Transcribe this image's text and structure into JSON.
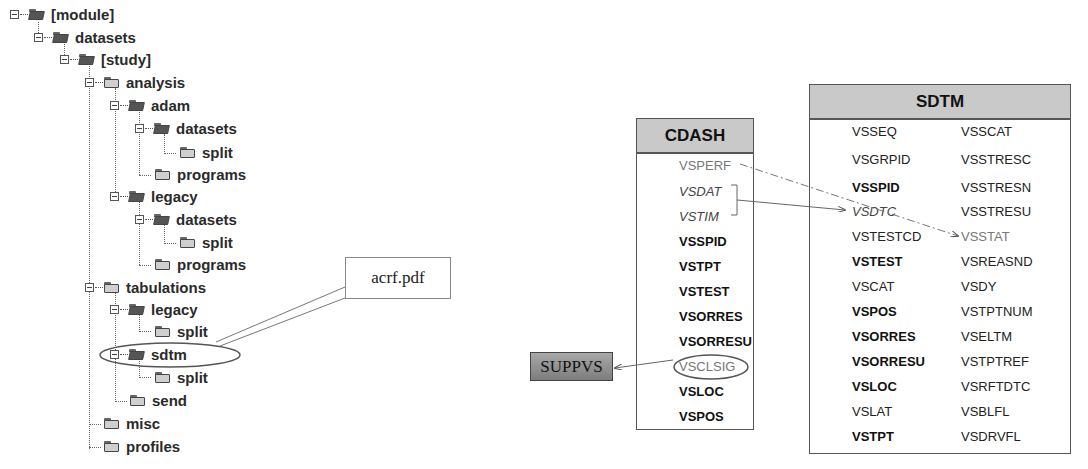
{
  "folder_tree": {
    "nodes": [
      {
        "label": "[module]",
        "level": 0,
        "expander": true,
        "open": true
      },
      {
        "label": "datasets",
        "level": 1,
        "expander": true,
        "open": true
      },
      {
        "label": "[study]",
        "level": 2,
        "expander": true,
        "open": true
      },
      {
        "label": "analysis",
        "level": 3,
        "expander": true,
        "open": false
      },
      {
        "label": "adam",
        "level": 4,
        "expander": true,
        "open": true
      },
      {
        "label": "datasets",
        "level": 5,
        "expander": true,
        "open": true
      },
      {
        "label": "split",
        "level": 6,
        "expander": false,
        "open": false
      },
      {
        "label": "programs",
        "level": 5,
        "expander": false,
        "open": false
      },
      {
        "label": "legacy",
        "level": 4,
        "expander": true,
        "open": true
      },
      {
        "label": "datasets",
        "level": 5,
        "expander": true,
        "open": true
      },
      {
        "label": "split",
        "level": 6,
        "expander": false,
        "open": false
      },
      {
        "label": "programs",
        "level": 5,
        "expander": false,
        "open": false
      },
      {
        "label": "tabulations",
        "level": 3,
        "expander": true,
        "open": false
      },
      {
        "label": "legacy",
        "level": 4,
        "expander": true,
        "open": true
      },
      {
        "label": "split",
        "level": 5,
        "expander": false,
        "open": false
      },
      {
        "label": "sdtm",
        "level": 4,
        "expander": true,
        "open": true,
        "highlighted": true
      },
      {
        "label": "split",
        "level": 5,
        "expander": false,
        "open": false
      },
      {
        "label": "send",
        "level": 4,
        "expander": false,
        "open": false
      },
      {
        "label": "misc",
        "level": 3,
        "expander": false,
        "open": false
      },
      {
        "label": "profiles",
        "level": 3,
        "expander": false,
        "open": false
      }
    ]
  },
  "callout": {
    "label": "acrf.pdf"
  },
  "cdash": {
    "title": "CDASH",
    "variables": [
      {
        "name": "VSPERF",
        "style": "grey"
      },
      {
        "name": "VSDAT",
        "style": "italic"
      },
      {
        "name": "VSTIM",
        "style": "italic"
      },
      {
        "name": "VSSPID",
        "style": "bold"
      },
      {
        "name": "VSTPT",
        "style": "bold"
      },
      {
        "name": "VSTEST",
        "style": "bold"
      },
      {
        "name": "VSORRES",
        "style": "bold"
      },
      {
        "name": "VSORRESU",
        "style": "bold"
      },
      {
        "name": "VSCLSIG",
        "style": "grey",
        "circled": true
      },
      {
        "name": "VSLOC",
        "style": "bold"
      },
      {
        "name": "VSPOS",
        "style": "bold"
      }
    ]
  },
  "sdtm": {
    "title": "SDTM",
    "col1": [
      {
        "name": "VSSEQ",
        "style": "normal"
      },
      {
        "name": "VSGRPID",
        "style": "normal"
      },
      {
        "name": "VSSPID",
        "style": "bold"
      },
      {
        "name": "VSDTC",
        "style": "italic"
      },
      {
        "name": "VSTESTCD",
        "style": "normal"
      },
      {
        "name": "VSTEST",
        "style": "bold"
      },
      {
        "name": "VSCAT",
        "style": "normal"
      },
      {
        "name": "VSPOS",
        "style": "bold"
      },
      {
        "name": "VSORRES",
        "style": "bold"
      },
      {
        "name": "VSORRESU",
        "style": "bold"
      },
      {
        "name": "VSLOC",
        "style": "bold"
      },
      {
        "name": "VSLAT",
        "style": "normal"
      },
      {
        "name": "VSTPT",
        "style": "bold"
      }
    ],
    "col2": [
      {
        "name": "VSSCAT",
        "style": "normal"
      },
      {
        "name": "VSSTRESC",
        "style": "normal"
      },
      {
        "name": "VSSTRESN",
        "style": "normal"
      },
      {
        "name": "VSSTRESU",
        "style": "normal"
      },
      {
        "name": "VSSTAT",
        "style": "grey"
      },
      {
        "name": "VSREASND",
        "style": "normal"
      },
      {
        "name": "VSDY",
        "style": "normal"
      },
      {
        "name": "VSTPTNUM",
        "style": "normal"
      },
      {
        "name": "VSELTM",
        "style": "normal"
      },
      {
        "name": "VSTPTREF",
        "style": "normal"
      },
      {
        "name": "VSRFTDTC",
        "style": "normal"
      },
      {
        "name": "VSBLFL",
        "style": "normal"
      },
      {
        "name": "VSDRVFL",
        "style": "normal"
      }
    ]
  },
  "suppvs": {
    "label": "SUPPVS"
  }
}
